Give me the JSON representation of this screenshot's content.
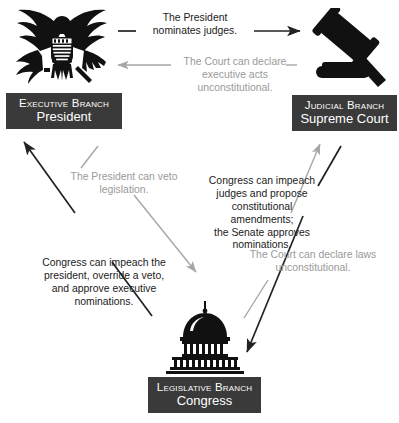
{
  "diagram": {
    "colors": {
      "plate_bg": "#3a3a3a",
      "plate_text": "#ffffff",
      "dark_edge": "#222222",
      "light_edge": "#a6a6a6",
      "dark_caption": "#1b1b1b",
      "light_caption": "#9a9a9a",
      "background": "#ffffff"
    }
  },
  "nodes": {
    "executive": {
      "branch": "Executive Branch",
      "name": "President",
      "icon": "eagle-seal-icon"
    },
    "judicial": {
      "branch": "Judicial Branch",
      "name": "Supreme Court",
      "icon": "gavel-icon"
    },
    "legislative": {
      "branch": "Legislative Branch",
      "name": "Congress",
      "icon": "capitol-dome-icon"
    }
  },
  "edges": {
    "nominates_judges": {
      "text": "The President nominates judges.",
      "lines": [
        "The President",
        "nominates judges."
      ],
      "from": "executive",
      "to": "judicial",
      "style": "dark",
      "direction": "right"
    },
    "executive_acts_unconstitutional": {
      "text": "The Court can declare executive acts unconstitutional.",
      "lines": [
        "The Court can declare",
        "executive acts",
        "unconstitutional."
      ],
      "from": "judicial",
      "to": "executive",
      "style": "light",
      "direction": "left"
    },
    "veto_legislation": {
      "text": "The President can veto legislation.",
      "lines": [
        "The President can veto",
        "legislation."
      ],
      "from": "executive",
      "to": "legislative",
      "style": "light",
      "direction": "down-right"
    },
    "congress_impeach_president": {
      "text": "Congress can impeach the president, override a veto, and approve executive nominations.",
      "lines": [
        "Congress can impeach the",
        "president, override a veto,",
        "and approve executive",
        "nominations."
      ],
      "from": "legislative",
      "to": "executive",
      "style": "dark",
      "direction": "up-left"
    },
    "congress_impeach_judges": {
      "text": "Congress can impeach judges and propose constitutional amendments; the Senate approves nominations.",
      "lines": [
        "Congress can impeach",
        "judges and propose",
        "constitutional amendments;",
        "the Senate approves",
        "nominations."
      ],
      "from": "legislative",
      "to": "judicial",
      "style": "light",
      "direction": "up-right"
    },
    "laws_unconstitutional": {
      "text": "The Court can declare laws unconstitutional.",
      "lines": [
        "The Court can declare laws",
        "unconstitutional."
      ],
      "from": "judicial",
      "to": "legislative",
      "style": "dark",
      "direction": "down-left"
    }
  }
}
